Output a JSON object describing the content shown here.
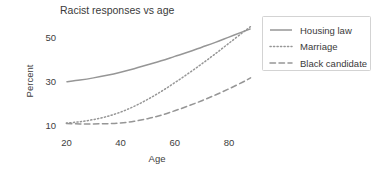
{
  "chart_data": {
    "type": "line",
    "title": "Racist responses vs age",
    "xlabel": "Age",
    "ylabel": "Percent",
    "xlim": [
      18,
      90
    ],
    "ylim": [
      6,
      58
    ],
    "xticks": [
      20,
      40,
      60,
      80
    ],
    "yticks": [
      10,
      30,
      50
    ],
    "grid": false,
    "legend_position": "right",
    "x": [
      20,
      25,
      30,
      35,
      40,
      45,
      50,
      55,
      60,
      65,
      70,
      75,
      80,
      85,
      88
    ],
    "series": [
      {
        "name": "Housing law",
        "style": "solid",
        "color": "#969696",
        "values": [
          29.8,
          30.6,
          31.6,
          32.8,
          34.2,
          35.8,
          37.6,
          39.4,
          41.4,
          43.4,
          45.6,
          47.8,
          50.2,
          52.6,
          54.0
        ]
      },
      {
        "name": "Marriage",
        "style": "dotted",
        "color": "#969696",
        "values": [
          11.0,
          11.6,
          12.6,
          14.0,
          16.0,
          18.6,
          21.8,
          25.4,
          29.4,
          33.6,
          38.0,
          42.6,
          47.4,
          52.2,
          55.0
        ]
      },
      {
        "name": "Black candidate",
        "style": "dashed",
        "color": "#969696",
        "values": [
          10.8,
          10.6,
          10.6,
          10.7,
          11.0,
          11.8,
          13.0,
          14.6,
          16.6,
          18.8,
          21.2,
          23.8,
          26.6,
          29.6,
          31.6
        ]
      }
    ],
    "legend": [
      {
        "label": "Housing law",
        "style": "solid"
      },
      {
        "label": "Marriage",
        "style": "dotted"
      },
      {
        "label": "Black candidate",
        "style": "dashed"
      }
    ]
  },
  "colors": {
    "line": "#969696",
    "text": "#3a3a3a",
    "legend_border": "#c8c8c8",
    "background": "#ffffff"
  }
}
